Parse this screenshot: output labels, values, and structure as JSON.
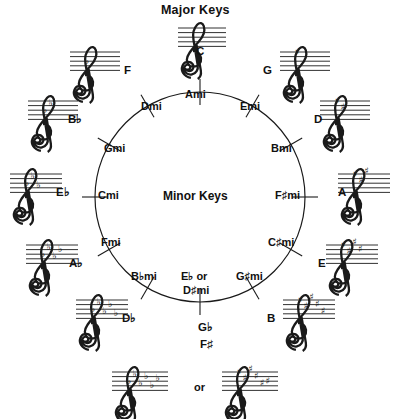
{
  "diagram": {
    "title_top": "Major Keys",
    "title_center": "Minor Keys",
    "or_label": "or",
    "circle": {
      "cx": 200,
      "cy": 197,
      "r": 105,
      "stroke": "#1a1a1a"
    }
  },
  "keys": [
    {
      "major": "C",
      "major_sup": "",
      "minor": "Ami",
      "angle": 0,
      "accidental_type": "natural",
      "accidental_count": 0
    },
    {
      "major": "G",
      "major_sup": "",
      "minor": "Emi",
      "angle": 30,
      "accidental_type": "sharp",
      "accidental_count": 1
    },
    {
      "major": "D",
      "major_sup": "",
      "minor": "Bmi",
      "angle": 60,
      "accidental_type": "sharp",
      "accidental_count": 2
    },
    {
      "major": "A",
      "major_sup": "",
      "minor": "F♯mi",
      "angle": 90,
      "accidental_type": "sharp",
      "accidental_count": 3
    },
    {
      "major": "E",
      "major_sup": "",
      "minor": "C♯mi",
      "angle": 120,
      "accidental_type": "sharp",
      "accidental_count": 4
    },
    {
      "major": "B",
      "major_sup": "",
      "minor": "G♯mi",
      "angle": 150,
      "accidental_type": "sharp",
      "accidental_count": 5
    },
    {
      "major": "G",
      "major_sup": "♭",
      "minor": "E♭ or",
      "minor2": "D♯mi",
      "angle": 180,
      "accidental_type": "flat",
      "accidental_count": 6,
      "major2": "F♯"
    },
    {
      "major": "D",
      "major_sup": "♭",
      "minor": "B♭mi",
      "angle": 210,
      "accidental_type": "flat",
      "accidental_count": 5
    },
    {
      "major": "A",
      "major_sup": "♭",
      "minor": "Fmi",
      "angle": 240,
      "accidental_type": "flat",
      "accidental_count": 4
    },
    {
      "major": "E",
      "major_sup": "♭",
      "minor": "Cmi",
      "angle": 270,
      "accidental_type": "flat",
      "accidental_count": 3
    },
    {
      "major": "B",
      "major_sup": "♭",
      "minor": "Gmi",
      "angle": 300,
      "accidental_type": "flat",
      "accidental_count": 2
    },
    {
      "major": "F",
      "major_sup": "",
      "minor": "Dmi",
      "angle": 330,
      "accidental_type": "flat",
      "accidental_count": 1
    }
  ],
  "bottom_note": {
    "flat_key": "G♭",
    "sharp_key": "F♯",
    "or": "or"
  },
  "labels": {
    "c": "C",
    "g": "G",
    "d": "D",
    "a": "A",
    "e": "E",
    "b": "B",
    "gb": "G♭",
    "fsharp": "F♯",
    "db": "D♭",
    "ab": "A♭",
    "eb": "E♭",
    "bb": "B♭",
    "f": "F",
    "ami": "Ami",
    "emi": "Emi",
    "bmi": "Bmi",
    "fsmi": "F♯mi",
    "csmi": "C♯mi",
    "gsmi": "G♯mi",
    "ebmi": "E♭ or",
    "dsmi": "D♯mi",
    "bbmi": "B♭mi",
    "fmi": "Fmi",
    "cmi": "Cmi",
    "gmi": "Gmi",
    "dmi": "Dmi"
  }
}
